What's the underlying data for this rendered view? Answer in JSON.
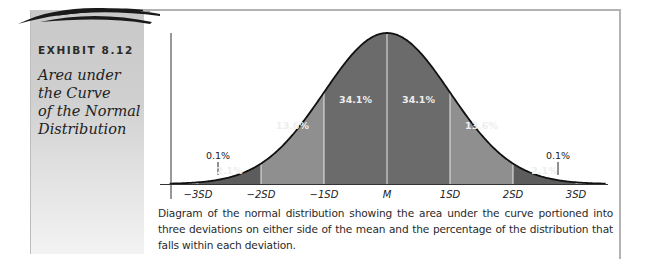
{
  "exhibit": {
    "label": "EXHIBIT 8.12",
    "title_lines": [
      "Area under",
      "the Curve",
      "of the Normal",
      "Distribution"
    ]
  },
  "caption": "Diagram of the normal distribution showing the area under the curve portioned into three deviations on either side of the mean and the percentage of the distribution that falls within each deviation.",
  "colors": {
    "tail": "#a9a9a9",
    "band_2_1": "#5c5c5c",
    "band_13_6": "#8f8f8f",
    "band_34_1": "#6b6b6b",
    "curve": "#111111",
    "label_light": "#eeeeee",
    "label_dark": "#222222"
  },
  "chart_data": {
    "type": "area",
    "title": "Area under the Curve of the Normal Distribution",
    "xlabel": "",
    "ylabel": "",
    "x_ticks": [
      "-3SD",
      "-2SD",
      "-1SD",
      "M",
      "1SD",
      "2SD",
      "3SD"
    ],
    "x_tick_values": [
      -3,
      -2,
      -1,
      0,
      1,
      2,
      3
    ],
    "xlim": [
      -3.5,
      3.5
    ],
    "segments": [
      {
        "from": -4,
        "to": -3,
        "percent": "0.1%",
        "value": 0.1
      },
      {
        "from": -3,
        "to": -2,
        "percent": "2.1%",
        "value": 2.1
      },
      {
        "from": -2,
        "to": -1,
        "percent": "13.6%",
        "value": 13.6
      },
      {
        "from": -1,
        "to": 0,
        "percent": "34.1%",
        "value": 34.1
      },
      {
        "from": 0,
        "to": 1,
        "percent": "34.1%",
        "value": 34.1
      },
      {
        "from": 1,
        "to": 2,
        "percent": "13.6%",
        "value": 13.6
      },
      {
        "from": 2,
        "to": 3,
        "percent": "2.1%",
        "value": 2.1
      },
      {
        "from": 3,
        "to": 4,
        "percent": "0.1%",
        "value": 0.1
      }
    ],
    "grid": false,
    "legend": "none"
  }
}
